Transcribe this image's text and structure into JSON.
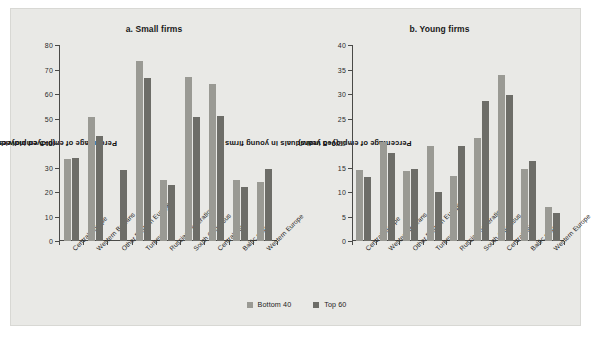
{
  "figure": {
    "background": "#e9e9e6",
    "series_colors": [
      "#9a9a94",
      "#6d6d68"
    ]
  },
  "legend": {
    "items": [
      {
        "label": "Bottom 40",
        "color": "#9a9a94"
      },
      {
        "label": "Top 60",
        "color": "#6d6d68"
      }
    ]
  },
  "chart_data": [
    {
      "type": "bar",
      "title": "a. Small firms",
      "xlabel": "",
      "ylabel": "Percentage of employed individuals in small firms (0–5 employees)",
      "ylabel_line1": "Percentage of employed individuals in small firms",
      "ylabel_line2": "(0–5 employees)",
      "ylim": [
        0,
        80
      ],
      "yticks": [
        0,
        10,
        20,
        30,
        40,
        50,
        60,
        70,
        80
      ],
      "grid": false,
      "legend_position": "bottom",
      "categories": [
        "Central Europe",
        "Western Balkans",
        "Other Eastern Europe",
        "Turkey",
        "Russian Federation",
        "South Caucasus",
        "Central Asia",
        "Baltic states",
        "Western Europe"
      ],
      "series": [
        {
          "name": "Bottom 40",
          "values": [
            33.5,
            50.5,
            null,
            73.5,
            25.0,
            67.0,
            64.0,
            25.0,
            24.0
          ]
        },
        {
          "name": "Top 60",
          "values": [
            34.0,
            43.0,
            29.0,
            66.5,
            23.0,
            50.5,
            51.0,
            22.0,
            29.5
          ]
        }
      ]
    },
    {
      "type": "bar",
      "title": "b. Young firms",
      "xlabel": "",
      "ylabel": "Percentage of employed individuals in young firms (0–5 years)",
      "ylabel_line1": "Percentage of employed individuals in young firms",
      "ylabel_line2": "(0–5 years)",
      "ylim": [
        0,
        40
      ],
      "yticks": [
        0,
        5,
        10,
        15,
        20,
        25,
        30,
        35,
        40
      ],
      "grid": false,
      "legend_position": "bottom",
      "categories": [
        "Central Europe",
        "Western Balkans",
        "Other Eastern Europe",
        "Turkey",
        "Russian Federation",
        "South Caucasus",
        "Central Asia",
        "Baltic states",
        "Western Europe"
      ],
      "series": [
        {
          "name": "Bottom 40",
          "values": [
            14.5,
            20.2,
            14.3,
            19.3,
            13.2,
            21.0,
            33.8,
            14.6,
            7.0
          ]
        },
        {
          "name": "Top 60",
          "values": [
            13.0,
            18.0,
            14.7,
            10.0,
            19.3,
            28.5,
            29.7,
            16.3,
            5.7
          ]
        }
      ]
    }
  ]
}
